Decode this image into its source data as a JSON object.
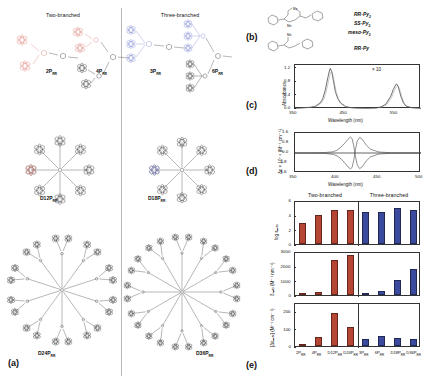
{
  "figure": {
    "panels": [
      "a",
      "b",
      "c",
      "d",
      "e"
    ]
  },
  "panel_a": {
    "label": "(a)",
    "header_left": "Two-branched",
    "header_right": "Three-branched",
    "accent_two_branched": "#e08a84",
    "accent_three_branched": "#8a93d6",
    "skeleton_color": "#4a4a4a",
    "compounds_left": [
      {
        "name": "2P",
        "sub": "RR",
        "x": 46,
        "y": 68
      },
      {
        "name": "4P",
        "sub": "RR",
        "x": 96,
        "y": 68
      },
      {
        "name": "D12P",
        "sub": "RR",
        "x": 40,
        "y": 195
      },
      {
        "name": "D24P",
        "sub": "RR",
        "x": 38,
        "y": 350
      }
    ],
    "compounds_right": [
      {
        "name": "3P",
        "sub": "RR",
        "x": 150,
        "y": 68
      },
      {
        "name": "6P",
        "sub": "RR",
        "x": 212,
        "y": 68
      },
      {
        "name": "D18P",
        "sub": "RR",
        "x": 148,
        "y": 195
      },
      {
        "name": "D36P",
        "sub": "RR",
        "x": 196,
        "y": 350
      }
    ]
  },
  "panel_b": {
    "label": "(b)",
    "structures": [
      {
        "id": "py2",
        "labels": [
          "RR-Py",
          "SS-Py",
          "meso-Py"
        ],
        "subscript": "2"
      },
      {
        "id": "py",
        "labels": [
          "RR-Py"
        ],
        "subscript": ""
      }
    ],
    "label_rr_py2": "RR-Py",
    "label_ss_py2": "SS-Py",
    "label_meso_py2": "meso-Py",
    "label_rr_py": "RR-Py",
    "sub_two": "2",
    "substituent_me": "Me"
  },
  "panel_c": {
    "label": "(c)",
    "annotation": "× 10"
  },
  "panel_d": {
    "label": "(d)"
  },
  "panel_e": {
    "label": "(e)",
    "header_left": "Two-branched",
    "header_right": "Three-branched",
    "color_two_branched": "#b54433",
    "color_three_branched": "#3b4a9c"
  },
  "chart_data": [
    {
      "type": "line",
      "panel": "c",
      "title": "",
      "xlabel": "Wavelength (nm)",
      "ylabel": "Absorbance",
      "xlim": [
        350,
        600
      ],
      "ylim": [
        0.0,
        1.3
      ],
      "xticks": [
        350,
        450,
        550
      ],
      "yticks": [
        0.0,
        0.4,
        0.8,
        1.2
      ],
      "annotations": [
        "× 10"
      ],
      "grid": false,
      "legend": false,
      "series": [
        {
          "name": "Soret + Q bands",
          "x": [
            350,
            360,
            370,
            380,
            390,
            400,
            405,
            410,
            415,
            418,
            420,
            423,
            426,
            430,
            435,
            440,
            450,
            460,
            470,
            490,
            510,
            520,
            530,
            540,
            545,
            550,
            552,
            555,
            560,
            565,
            570,
            580,
            590,
            600
          ],
          "values": [
            0.02,
            0.03,
            0.04,
            0.05,
            0.08,
            0.18,
            0.3,
            0.55,
            0.92,
            1.12,
            1.2,
            1.1,
            0.85,
            0.52,
            0.3,
            0.18,
            0.07,
            0.04,
            0.03,
            0.02,
            0.03,
            0.06,
            0.14,
            0.38,
            0.58,
            0.72,
            0.74,
            0.66,
            0.38,
            0.18,
            0.09,
            0.04,
            0.03,
            0.02
          ]
        }
      ]
    },
    {
      "type": "line",
      "panel": "d",
      "title": "",
      "xlabel": "Wavelength (nm)",
      "ylabel": "Δε × 10⁻⁵ (M⁻¹ cm⁻¹)",
      "xlim": [
        350,
        500
      ],
      "ylim": [
        -1.6,
        1.6
      ],
      "xticks": [
        350,
        400,
        450,
        500
      ],
      "yticks": [
        -1.6,
        -0.8,
        0.0,
        0.8,
        1.6
      ],
      "grid": false,
      "legend": false,
      "series": [
        {
          "name": "RR isomer",
          "x": [
            350,
            370,
            385,
            395,
            400,
            405,
            410,
            413,
            416,
            418,
            420,
            422,
            424,
            427,
            430,
            435,
            440,
            450,
            465,
            480,
            500
          ],
          "values": [
            0.0,
            0.01,
            0.03,
            0.1,
            0.22,
            0.48,
            0.85,
            1.1,
            1.28,
            1.15,
            0.55,
            -0.3,
            -0.95,
            -1.25,
            -1.1,
            -0.62,
            -0.3,
            -0.08,
            -0.02,
            0.0,
            0.0
          ]
        },
        {
          "name": "SS isomer",
          "x": [
            350,
            370,
            385,
            395,
            400,
            405,
            410,
            413,
            416,
            418,
            420,
            422,
            424,
            427,
            430,
            435,
            440,
            450,
            465,
            480,
            500
          ],
          "values": [
            0.0,
            -0.01,
            -0.03,
            -0.1,
            -0.22,
            -0.48,
            -0.85,
            -1.1,
            -1.28,
            -1.15,
            -0.55,
            0.3,
            0.95,
            1.25,
            1.1,
            0.62,
            0.3,
            0.08,
            0.02,
            0.0,
            0.0
          ]
        },
        {
          "name": "meso isomer",
          "x": [
            350,
            400,
            420,
            450,
            500
          ],
          "values": [
            0.0,
            0.0,
            0.0,
            0.0,
            0.0
          ]
        }
      ]
    },
    {
      "type": "bar",
      "panel": "e-top",
      "title": "",
      "xlabel": "",
      "ylabel": "log εₘₐₓ",
      "ylim": [
        0,
        6
      ],
      "yticks": [
        0,
        2,
        4,
        6
      ],
      "categories": [
        "2P",
        "4P",
        "D12P",
        "D24P",
        "3P",
        "6P",
        "D18P",
        "D36P"
      ],
      "category_subs": [
        "RR",
        "RR",
        "RR",
        "RR",
        "RR",
        "RR",
        "RR",
        "RR"
      ],
      "groups": [
        "Two-branched",
        "Two-branched",
        "Two-branched",
        "Two-branched",
        "Three-branched",
        "Three-branched",
        "Three-branched",
        "Three-branched"
      ],
      "values": [
        2.9,
        4.0,
        4.7,
        4.6,
        4.3,
        4.3,
        4.9,
        4.6
      ]
    },
    {
      "type": "bar",
      "panel": "e-middle",
      "title": "",
      "xlabel": "",
      "ylabel": "δₘₐₓ (M⁻¹ nm⁻¹)",
      "ylim": [
        0,
        3000
      ],
      "yticks": [
        0,
        1000,
        2000,
        3000
      ],
      "categories": [
        "2P",
        "4P",
        "D12P",
        "D24P",
        "3P",
        "6P",
        "D18P",
        "D36P"
      ],
      "groups": [
        "Two-branched",
        "Two-branched",
        "Two-branched",
        "Two-branched",
        "Three-branched",
        "Three-branched",
        "Three-branched",
        "Three-branched"
      ],
      "values": [
        20,
        210,
        2400,
        2750,
        90,
        290,
        1000,
        1750
      ]
    },
    {
      "type": "bar",
      "panel": "e-bottom",
      "title": "",
      "xlabel": "",
      "ylabel": "[Δεₘₐₓ] (M⁻¹ cm⁻¹)",
      "ylim": [
        0,
        250
      ],
      "yticks": [
        0,
        100,
        200
      ],
      "categories": [
        "2P",
        "4P",
        "D12P",
        "D24P",
        "3P",
        "6P",
        "D18P",
        "D36P"
      ],
      "groups": [
        "Two-branched",
        "Two-branched",
        "Two-branched",
        "Two-branched",
        "Three-branched",
        "Three-branched",
        "Three-branched",
        "Three-branched"
      ],
      "values": [
        5,
        50,
        190,
        110,
        38,
        55,
        45,
        42
      ]
    }
  ]
}
